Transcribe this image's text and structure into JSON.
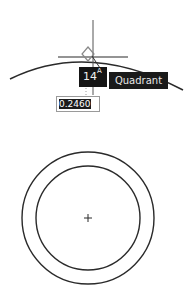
{
  "drawing": {
    "arc": {
      "stroke": "#2a2a2a"
    },
    "circles": {
      "center": {
        "x": 88,
        "y": 218
      },
      "outer_radius": 66,
      "inner_radius": 52,
      "stroke": "#2a2a2a"
    }
  },
  "snap": {
    "marker_icon": "diamond-quadrant-icon",
    "tooltip_label": "Quadrant"
  },
  "dynamic_input": {
    "angle_value": "14",
    "angle_suffix": "A",
    "length_value": "0.2460"
  }
}
